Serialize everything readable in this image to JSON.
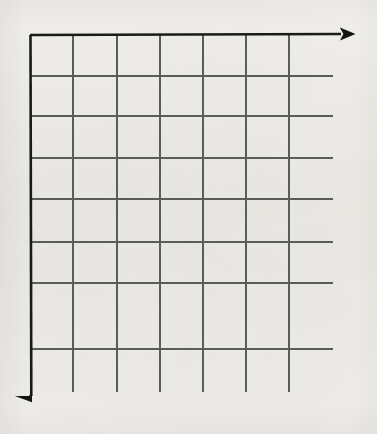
{
  "figure": {
    "description": "Hand-drawn / photocopied blank grid chart: bold horizontal axis along the top with a right-pointing arrowhead, bold vertical axis along the left with a downward-pointing arrowhead, and an unlabeled interior grid of thin gray rules.",
    "width": 377,
    "height": 434
  },
  "colors": {
    "background": "#f7f6f4",
    "axis": "#1a1a1a",
    "grid_line": "#5b5b5b",
    "grid_line_light": "#717171",
    "arrowhead": "#141414"
  },
  "axes": {
    "horizontal": {
      "label": "",
      "orientation": "horizontal",
      "direction": "right",
      "x_start": 30,
      "x_end": 358,
      "y": 35,
      "stroke_width": 2.6,
      "arrowhead": "right-arrowhead",
      "arrow_tip_x": 358,
      "arrow_tip_y": 34
    },
    "vertical": {
      "label": "",
      "orientation": "vertical",
      "direction": "down",
      "y_start": 35,
      "y_end": 412,
      "x": 30,
      "stroke_width": 2.6,
      "arrowhead": "down-arrowhead",
      "arrow_tip_x": 31,
      "arrow_tip_y": 412
    }
  },
  "chart_data": {
    "type": "table",
    "title": "",
    "subtitle": "",
    "xlabel": "",
    "ylabel": "",
    "series": [],
    "categories": [],
    "values": [],
    "annotations": [],
    "legend": {
      "entries": [],
      "position": "none"
    },
    "grid": {
      "visible": true,
      "columns": 6,
      "rows": 7,
      "vertical_line_count": 7,
      "horizontal_line_count": 8,
      "vertical_line_x": [
        30,
        73,
        117,
        160,
        203,
        246,
        289
      ],
      "horizontal_line_y": [
        35,
        76,
        116,
        158,
        199,
        242,
        283,
        349
      ],
      "vertical_lines_bottom_y": 392,
      "horizontal_lines_right_x": 333,
      "cell_width": 43.2,
      "cell_height": 44.9,
      "note": "Grid is empty — no plotted data, no tick labels, no legend."
    },
    "axis_ranges": {
      "x": [],
      "y": []
    }
  },
  "ticks": {
    "x_tick_labels": [],
    "y_tick_labels": []
  }
}
